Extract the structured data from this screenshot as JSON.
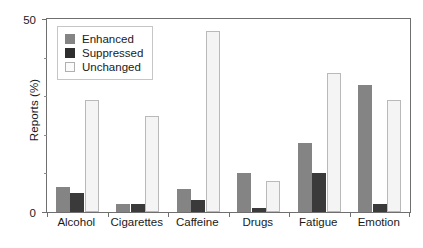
{
  "chart_data": {
    "type": "bar",
    "title": "",
    "xlabel": "",
    "ylabel": "Reports (%)",
    "ylim": [
      0,
      50
    ],
    "ytick_labels": [
      "0",
      "50"
    ],
    "grid": false,
    "legend_position": "top-left",
    "categories": [
      "Alcohol",
      "Cigarettes",
      "Caffeine",
      "Drugs",
      "Fatigue",
      "Emotion"
    ],
    "series": [
      {
        "name": "Enhanced",
        "color": "#848484",
        "values": [
          6.5,
          2,
          6,
          10,
          18,
          33
        ]
      },
      {
        "name": "Suppressed",
        "color": "#2e2e2e",
        "values": [
          5,
          2,
          3,
          1,
          10,
          2
        ]
      },
      {
        "name": "Unchanged",
        "color": "#fbfbfb",
        "values": [
          29,
          25,
          47,
          8,
          36,
          29
        ]
      }
    ]
  },
  "axes": {
    "y_max_label": "50",
    "y_min_label": "0",
    "y_title": "Reports (%)"
  },
  "legend": {
    "entries": [
      {
        "label": "Enhanced",
        "swatch": "enhanced"
      },
      {
        "label": "Suppressed",
        "swatch": "suppressed"
      },
      {
        "label": "Unchanged",
        "swatch": "unchanged"
      }
    ]
  }
}
